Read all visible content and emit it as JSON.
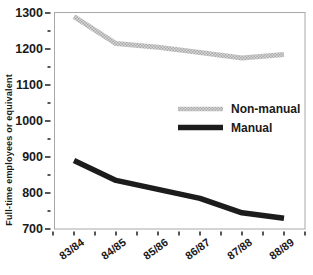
{
  "chart_data": {
    "type": "line",
    "title": "",
    "xlabel": "",
    "ylabel": "Full-time employees or equivalent",
    "categories": [
      "83/84",
      "84/85",
      "85/86",
      "86/87",
      "87/88",
      "88/89"
    ],
    "series": [
      {
        "name": "Non-manual",
        "values": [
          1290,
          1215,
          1205,
          1190,
          1175,
          1185
        ],
        "style": "halftone-gray-thick",
        "color": "#b2b2b2"
      },
      {
        "name": "Manual",
        "values": [
          890,
          835,
          810,
          785,
          745,
          730
        ],
        "style": "solid-black-thick",
        "color": "#1c1c1c"
      }
    ],
    "ylim": [
      700,
      1300
    ],
    "yticks": [
      700,
      800,
      900,
      1000,
      1100,
      1200,
      1300
    ],
    "ytick_step": 100,
    "ytick_minor_step": 50,
    "x_minor_ticks_between_labels": true,
    "grid": false,
    "legend_position": "center-right-inside",
    "frame_color": "#a8a8a8",
    "tick_color": "#2b2b2b",
    "text_color": "#1a1a1a",
    "background_color": "#ffffff"
  }
}
